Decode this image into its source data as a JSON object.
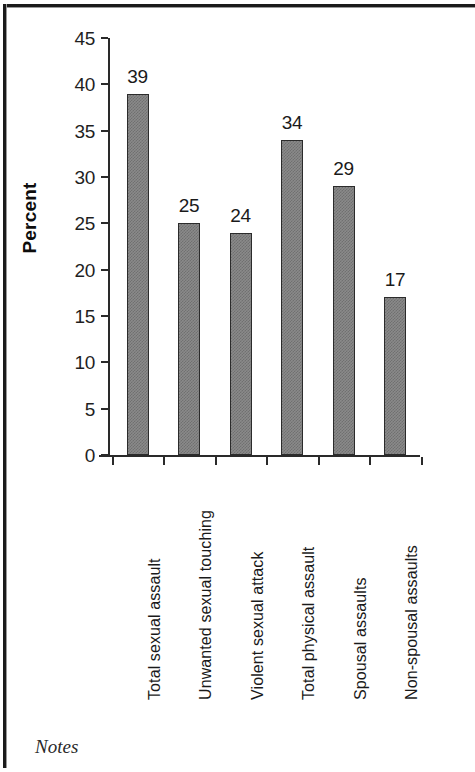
{
  "chart_data": {
    "type": "bar",
    "title": "",
    "xlabel": "",
    "ylabel": "Percent",
    "ylim": [
      0,
      45
    ],
    "ytick_step": 5,
    "yticks": [
      "45",
      "40",
      "35",
      "30",
      "25",
      "20",
      "15",
      "10",
      "5",
      "0"
    ],
    "grid": false,
    "legend": false,
    "categories": [
      "Total sexual assault",
      "Unwanted sexual touching",
      "Violent sexual attack",
      "Total physical assault",
      "Spousal assaults",
      "Non-spousal assaults"
    ],
    "values": [
      39,
      25,
      24,
      34,
      29,
      17
    ],
    "value_labels": [
      "39",
      "25",
      "24",
      "34",
      "29",
      "17"
    ],
    "bar_fill_color": "#808080",
    "bar_edge_color": "#2b2b2b",
    "axis_color": "#2a2a2a"
  },
  "footer": {
    "notes_label": "Notes"
  }
}
